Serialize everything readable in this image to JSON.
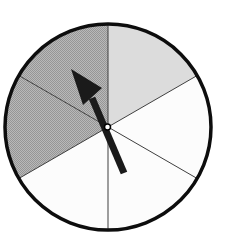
{
  "meta": {
    "canvas": {
      "width": 225,
      "height": 247
    },
    "background": "#ffffff"
  },
  "spinner": {
    "center": {
      "x": 108,
      "y": 127
    },
    "radius": 103,
    "outline": {
      "color": "#0d0d0d",
      "width": 3.5
    },
    "divider": {
      "color": "#3f3f3f",
      "width": 1
    },
    "divider_angles_deg": [
      0,
      60,
      120,
      180,
      240,
      300
    ],
    "sector_angle_deg": 60,
    "sectors": [
      {
        "name": "sector-top-right",
        "start": 0,
        "end": 60,
        "fill": "light-gray"
      },
      {
        "name": "sector-right",
        "start": 60,
        "end": 120,
        "fill": "white"
      },
      {
        "name": "sector-bottom-right",
        "start": 120,
        "end": 180,
        "fill": "white"
      },
      {
        "name": "sector-bottom-left",
        "start": 180,
        "end": 240,
        "fill": "white"
      },
      {
        "name": "sector-left",
        "start": 240,
        "end": 300,
        "fill": "dark-stipple"
      },
      {
        "name": "sector-top-left",
        "start": 300,
        "end": 360,
        "fill": "dark-stipple"
      }
    ],
    "fills": {
      "light-gray": "#dcdcdc",
      "white": "#fcfcfc",
      "dark-stipple": "pattern:stipple"
    },
    "stipple": {
      "light": "#b9b9b9",
      "dark": "#969696"
    },
    "arrow": {
      "color": "#1a1a1a",
      "points_into": "sector-top-left",
      "head": [
        [
          71,
          69
        ],
        [
          102,
          88
        ],
        [
          83,
          105
        ]
      ],
      "shaft": {
        "from": {
          "x": 124,
          "y": 173
        },
        "to": {
          "x": 92,
          "y": 98
        },
        "width": 7
      },
      "pin": {
        "x": 107.5,
        "y": 127,
        "r": 3,
        "fill": "#ffffff",
        "stroke": "#000000",
        "stroke_width": 1.5
      }
    }
  }
}
